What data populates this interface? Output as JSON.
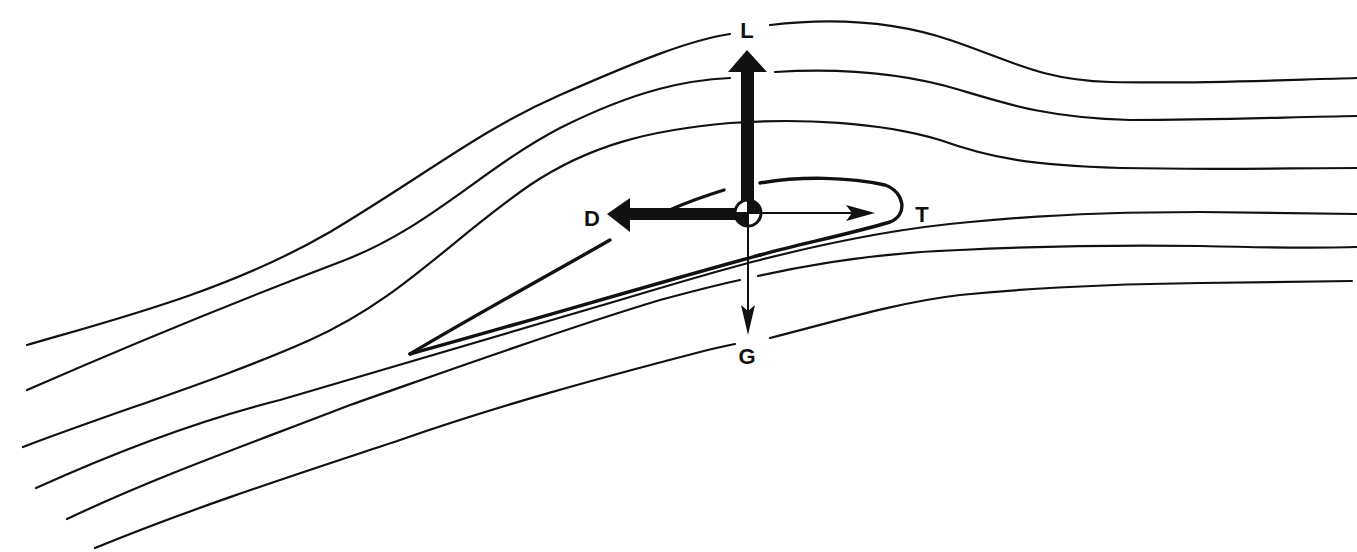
{
  "figure": {
    "background_color": "#ffffff",
    "ink_color": "#111111"
  },
  "labels": {
    "lift": "L",
    "drag": "D",
    "thrust": "T",
    "gravity": "G"
  },
  "forces": [
    {
      "id": "lift",
      "label": "L",
      "direction": "up",
      "weight": "heavy"
    },
    {
      "id": "drag",
      "label": "D",
      "direction": "left",
      "weight": "heavy"
    },
    {
      "id": "thrust",
      "label": "T",
      "direction": "right",
      "weight": "light"
    },
    {
      "id": "gravity",
      "label": "G",
      "direction": "down",
      "weight": "light"
    }
  ],
  "center_of_gravity": {
    "symbol": "quartered-circle",
    "filled_quadrants": [
      "top-right",
      "bottom-left"
    ]
  },
  "streamlines_count": 6
}
